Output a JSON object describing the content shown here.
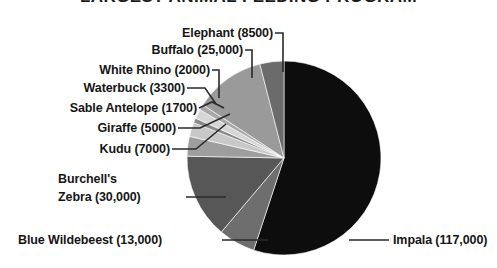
{
  "chart_data": {
    "type": "pie",
    "title": "LARGEST ANIMAL FEEDING PROGRAM",
    "xlabel": "",
    "ylabel": "",
    "total": 189500,
    "legend_position": "callout-labels",
    "grid": false,
    "categories": [
      "Impala",
      "Blue Wildebeest",
      "Burchell's Zebra",
      "Kudu",
      "Giraffe",
      "Sable Antelope",
      "Waterbuck",
      "White Rhino",
      "Buffalo",
      "Elephant"
    ],
    "values": [
      117000,
      13000,
      30000,
      7000,
      5000,
      1700,
      3300,
      2000,
      25000,
      8500
    ],
    "slices": [
      {
        "label": "Impala (117,000)",
        "name": "Impala",
        "value": 117000,
        "value_text": "117,000",
        "color": "#0d0d0d"
      },
      {
        "label": "Blue Wildebeest (13,000)",
        "name": "Blue Wildebeest",
        "value": 13000,
        "value_text": "13,000",
        "color": "#6e6e6e"
      },
      {
        "label": "Burchell's Zebra (30,000)",
        "name": "Burchell's Zebra",
        "value": 30000,
        "value_text": "30,000",
        "color": "#575757"
      },
      {
        "label": "Kudu (7000)",
        "name": "Kudu",
        "value": 7000,
        "value_text": "7000",
        "color": "#9e9e9e"
      },
      {
        "label": "Giraffe (5000)",
        "name": "Giraffe",
        "value": 5000,
        "value_text": "5000",
        "color": "#c8c8c8"
      },
      {
        "label": "Sable Antelope (1700)",
        "name": "Sable Antelope",
        "value": 1700,
        "value_text": "1700",
        "color": "#8a8a8a"
      },
      {
        "label": "Waterbuck (3300)",
        "name": "Waterbuck",
        "value": 3300,
        "value_text": "3300",
        "color": "#d6d6d6"
      },
      {
        "label": "White Rhino (2000)",
        "name": "White Rhino",
        "value": 2000,
        "value_text": "2000",
        "color": "#a8a8a8"
      },
      {
        "label": "Buffalo (25,000)",
        "name": "Buffalo",
        "value": 25000,
        "value_text": "25,000",
        "color": "#9a9a9a"
      },
      {
        "label": "Elephant (8500)",
        "name": "Elephant",
        "value": 8500,
        "value_text": "8500",
        "color": "#6b6b6b"
      }
    ]
  },
  "labels": {
    "elephant": "Elephant (8500)",
    "buffalo": "Buffalo (25,000)",
    "white_rhino": "White Rhino (2000)",
    "waterbuck": "Waterbuck (3300)",
    "sable_antelope": "Sable Antelope (1700)",
    "giraffe": "Giraffe (5000)",
    "kudu": "Kudu (7000)",
    "zebra_line1": "Burchell's",
    "zebra_line2": "Zebra (30,000)",
    "blue_wildebeest": "Blue Wildebeest (13,000)",
    "impala": "Impala (117,000)"
  },
  "colors": {
    "background": "#ffffff",
    "text": "#161616",
    "leader": "#2a2a2a"
  }
}
